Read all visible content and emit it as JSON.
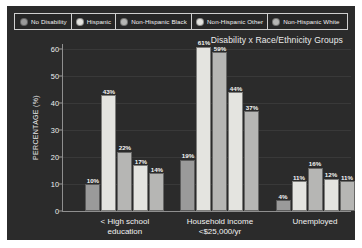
{
  "chart_data": {
    "type": "bar",
    "title": "Disability x Race/Ethnicity Groups",
    "xlabel": "",
    "ylabel": "PERCENTAGE (%)",
    "ylim": [
      0,
      62
    ],
    "yticks": [
      0,
      10,
      20,
      30,
      40,
      50,
      60
    ],
    "grid": false,
    "legend_position": "top",
    "categories": [
      "< High school education",
      "Household income\n<$25,000/yr",
      "Unemployed"
    ],
    "series": [
      {
        "name": "No Disability",
        "color": "#9a9a9a",
        "values": [
          10,
          19,
          4
        ],
        "labels": [
          "10%",
          "19%",
          "4%"
        ]
      },
      {
        "name": "Hispanic",
        "color": "#e4e4e0",
        "values": [
          43,
          61,
          11
        ],
        "labels": [
          "43%",
          "61%",
          "11%"
        ]
      },
      {
        "name": "Non-Hispanic Black",
        "color": "#b6b6b4",
        "values": [
          22,
          59,
          16
        ],
        "labels": [
          "22%",
          "59%",
          "16%"
        ]
      },
      {
        "name": "Non-Hispanic Other",
        "color": "#e4e4e0",
        "values": [
          17,
          44,
          12
        ],
        "labels": [
          "17%",
          "44%",
          "12%"
        ]
      },
      {
        "name": "Non-Hispanic White",
        "color": "#b6b6b4",
        "values": [
          14,
          37,
          11
        ],
        "labels": [
          "14%",
          "37%",
          "11%"
        ]
      }
    ]
  },
  "legend": {
    "items": [
      {
        "label": "No Disability",
        "color": "#9a9a9a"
      },
      {
        "label": "Hispanic",
        "color": "#e4e4e0"
      },
      {
        "label": "Non-Hispanic Black",
        "color": "#b6b6b4"
      },
      {
        "label": "Non-Hispanic Other",
        "color": "#e4e4e0"
      },
      {
        "label": "Non-Hispanic White",
        "color": "#b6b6b4"
      }
    ]
  },
  "axis": {
    "y_title": "PERCENTAGE (%)",
    "y_ticks": [
      "0",
      "10",
      "20",
      "30",
      "40",
      "50",
      "60"
    ]
  },
  "title": "Disability x Race/Ethnicity Groups",
  "theme": {
    "panel_background": "#2b2b2b",
    "page_background": "#ffffff",
    "text_color": "#f2f2f2",
    "axis_color": "#8f8f8f"
  }
}
